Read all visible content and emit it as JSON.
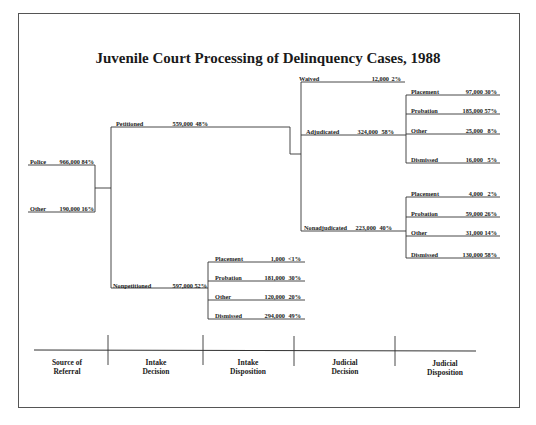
{
  "title": "Juvenile Court Processing of Delinquency Cases, 1988",
  "source_of_referral": [
    {
      "label": "Police",
      "count": "966,000",
      "pct": "84%"
    },
    {
      "label": "Other",
      "count": "190,000",
      "pct": "16%"
    }
  ],
  "intake_decision": {
    "petitioned": {
      "label": "Petitioned",
      "count": "559,000",
      "pct": "48%"
    },
    "nonpetitioned": {
      "label": "Nonpetitioned",
      "count": "597,000",
      "pct": "52%"
    }
  },
  "intake_disposition": [
    {
      "label": "Placement",
      "count": "1,000",
      "pct": "<1%"
    },
    {
      "label": "Probation",
      "count": "181,000",
      "pct": "30%"
    },
    {
      "label": "Other",
      "count": "120,000",
      "pct": "20%"
    },
    {
      "label": "Dismissed",
      "count": "294,000",
      "pct": "49%"
    }
  ],
  "judicial_decision": {
    "waived": {
      "label": "Waived",
      "count": "12,000",
      "pct": "2%"
    },
    "adjudicated": {
      "label": "Adjudicated",
      "count": "324,000",
      "pct": "58%"
    },
    "nonadjudicated": {
      "label": "Nonadjudicated",
      "count": "223,000",
      "pct": "40%"
    }
  },
  "judicial_disposition_adjudicated": [
    {
      "label": "Placement",
      "count": "97,000",
      "pct": "30%"
    },
    {
      "label": "Probation",
      "count": "185,000",
      "pct": "57%"
    },
    {
      "label": "Other",
      "count": "25,000",
      "pct": "8%"
    },
    {
      "label": "Dismissed",
      "count": "16,000",
      "pct": "5%"
    }
  ],
  "judicial_disposition_nonadjudicated": [
    {
      "label": "Placement",
      "count": "4,000",
      "pct": "2%"
    },
    {
      "label": "Probation",
      "count": "59,000",
      "pct": "26%"
    },
    {
      "label": "Other",
      "count": "31,000",
      "pct": "14%"
    },
    {
      "label": "Dismissed",
      "count": "130,000",
      "pct": "58%"
    }
  ],
  "stages": [
    {
      "line1": "Source of",
      "line2": "Referral"
    },
    {
      "line1": "Intake",
      "line2": "Decision"
    },
    {
      "line1": "Intake",
      "line2": "Disposition"
    },
    {
      "line1": "Judicial",
      "line2": "Decision"
    },
    {
      "line1": "Judicial",
      "line2": "Disposition"
    }
  ]
}
